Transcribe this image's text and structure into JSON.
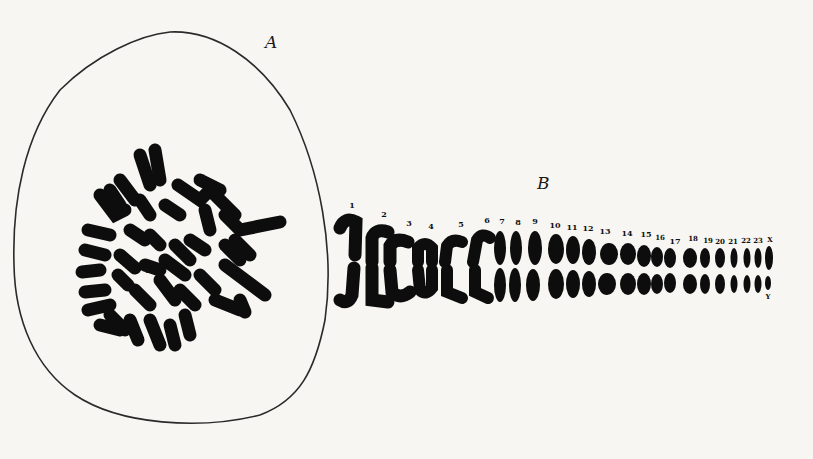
{
  "figure": {
    "panel_a": {
      "label": "A",
      "description": "Metaphase spread of chromosomes within a cell outline",
      "marker": "Y"
    },
    "panel_b": {
      "label": "B",
      "description": "Karyotype: chromosome pairs arranged by number",
      "pair_labels": [
        "1",
        "2",
        "3",
        "4",
        "5",
        "6",
        "7",
        "8",
        "9",
        "10",
        "11",
        "12",
        "13",
        "14",
        "15",
        "16",
        "17",
        "18",
        "19",
        "20",
        "21",
        "22",
        "23",
        "X"
      ],
      "sex_bottom_label": "Y"
    },
    "colors": {
      "background": "#f7f6f3",
      "ink": "#0d0d0d",
      "outline": "#2a2a2a"
    }
  }
}
